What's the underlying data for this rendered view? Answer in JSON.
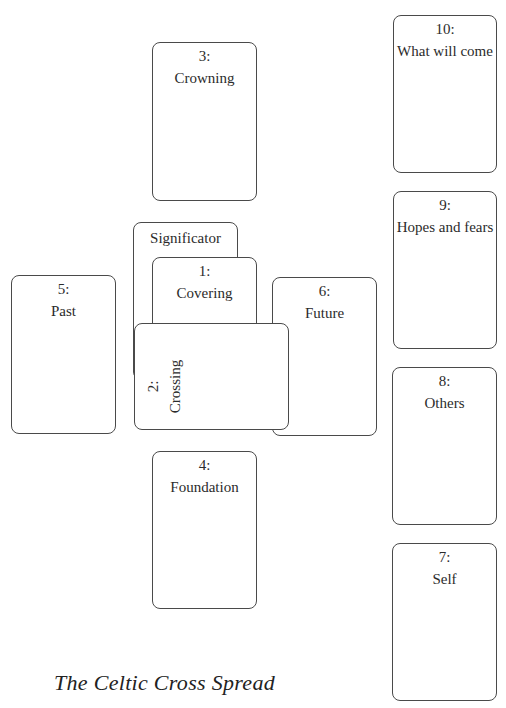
{
  "title": "The Celtic Cross Spread",
  "cards": {
    "c10": {
      "num": "10:",
      "label": "What will come"
    },
    "c9": {
      "num": "9:",
      "label": "Hopes and fears"
    },
    "c8": {
      "num": "8:",
      "label": "Others"
    },
    "c7": {
      "num": "7:",
      "label": "Self"
    },
    "c3": {
      "num": "3:",
      "label": "Crowning"
    },
    "c5": {
      "num": "5:",
      "label": "Past"
    },
    "sig": {
      "label": "Significator"
    },
    "c1": {
      "num": "1:",
      "label": "Covering"
    },
    "c6": {
      "num": "6:",
      "label": "Future"
    },
    "c2": {
      "num": "2:",
      "label": "Crossing"
    },
    "c4": {
      "num": "4:",
      "label": "Foundation"
    }
  }
}
